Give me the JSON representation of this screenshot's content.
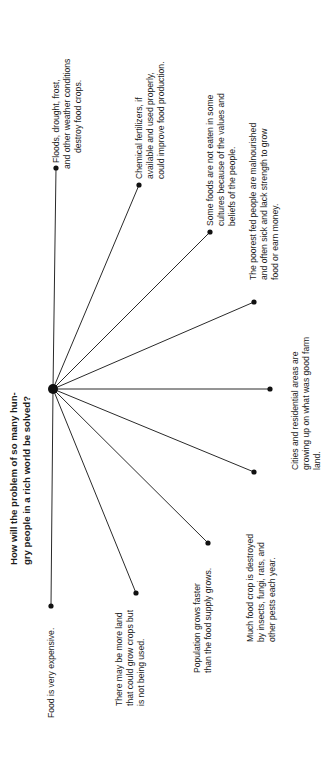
{
  "diagram": {
    "type": "spider-map",
    "title": {
      "lines": [
        "How will the problem of so many hun-",
        "gry people in a rich world be solved?"
      ]
    },
    "hub": {
      "x": 53,
      "y": 389
    },
    "colors": {
      "line": "#2a2a2a",
      "text": "#1c1c1c",
      "background": "#ffffff"
    },
    "branches": [
      {
        "id": "floods",
        "end": {
          "x": 56,
          "y": 168
        },
        "lines": [
          "Floods, drought, frost,",
          "and other weather conditions",
          "destroy food crops."
        ]
      },
      {
        "id": "fertilizers",
        "end": {
          "x": 139,
          "y": 185
        },
        "lines": [
          "Chemical fertilizers, if",
          "available and used properly,",
          "could improve food production."
        ]
      },
      {
        "id": "cultural-values",
        "end": {
          "x": 210,
          "y": 232
        },
        "lines": [
          "Some foods are not eaten in some",
          "cultures because of the values and",
          "beliefs of the people."
        ]
      },
      {
        "id": "malnourished",
        "end": {
          "x": 254,
          "y": 302
        },
        "lines": [
          "The poorest fed people are malnourished",
          "and often sick and lack strength to grow",
          "food or earn money."
        ]
      },
      {
        "id": "cities",
        "end": {
          "x": 270,
          "y": 389
        },
        "lines": [
          "Cities and residential areas are",
          "growing up on what was good farm",
          "land."
        ]
      },
      {
        "id": "pests",
        "end": {
          "x": 254,
          "y": 472
        },
        "lines": [
          "Much food crop is destroyed",
          "by insects, fungi, rats, and",
          "other pests each year."
        ]
      },
      {
        "id": "population",
        "end": {
          "x": 208,
          "y": 543
        },
        "lines": [
          "Population grows faster",
          "than the food supply grows."
        ]
      },
      {
        "id": "unused-land",
        "end": {
          "x": 136,
          "y": 593
        },
        "lines": [
          "There may be more land",
          "that could grow crops but",
          "is not being used."
        ]
      },
      {
        "id": "expensive",
        "end": {
          "x": 51,
          "y": 606
        },
        "lines": [
          "Food is very expensive."
        ]
      }
    ]
  }
}
